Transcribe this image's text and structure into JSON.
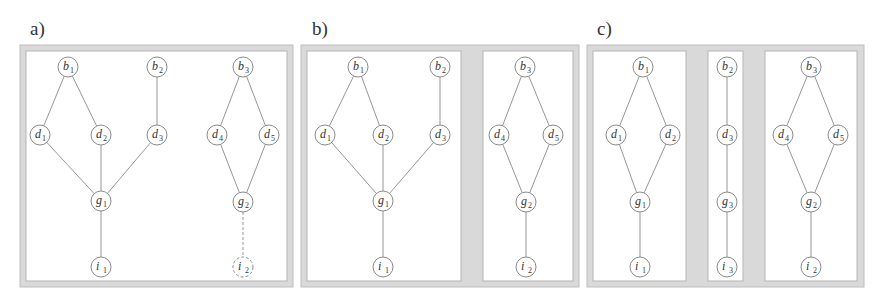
{
  "figure": {
    "colors": {
      "frame_fill": "#d9d9d9",
      "panel_fill": "#ffffff",
      "line": "#8a8a8a",
      "text": "#333333"
    },
    "node_radius": 10,
    "panels": [
      {
        "id": "a",
        "label": "a)",
        "label_pos": [
          30,
          35
        ],
        "outer": [
          20,
          45,
          273,
          242
        ],
        "sections": [
          [
            26,
            51,
            261,
            230
          ]
        ],
        "nodes": [
          {
            "id": "b1",
            "letter": "b",
            "sub": "1",
            "x": 68,
            "y": 67
          },
          {
            "id": "b2",
            "letter": "b",
            "sub": "2",
            "x": 157,
            "y": 67
          },
          {
            "id": "b3",
            "letter": "b",
            "sub": "3",
            "x": 243,
            "y": 67
          },
          {
            "id": "d1",
            "letter": "d",
            "sub": "1",
            "x": 40,
            "y": 135
          },
          {
            "id": "d2",
            "letter": "d",
            "sub": "2",
            "x": 101,
            "y": 135
          },
          {
            "id": "d3",
            "letter": "d",
            "sub": "3",
            "x": 157,
            "y": 135
          },
          {
            "id": "d4",
            "letter": "d",
            "sub": "4",
            "x": 217,
            "y": 135
          },
          {
            "id": "d5",
            "letter": "d",
            "sub": "5",
            "x": 269,
            "y": 135
          },
          {
            "id": "g1",
            "letter": "g",
            "sub": "1",
            "x": 101,
            "y": 201
          },
          {
            "id": "g2",
            "letter": "g",
            "sub": "2",
            "x": 243,
            "y": 202
          },
          {
            "id": "i1",
            "letter": "i",
            "sub": "1",
            "x": 101,
            "y": 267
          },
          {
            "id": "i2",
            "letter": "i",
            "sub": "2",
            "x": 243,
            "y": 267,
            "dashed": true
          }
        ],
        "edges": [
          [
            "b1",
            "d1"
          ],
          [
            "b1",
            "d2"
          ],
          [
            "b2",
            "d3"
          ],
          [
            "b3",
            "d4"
          ],
          [
            "b3",
            "d5"
          ],
          [
            "d1",
            "g1"
          ],
          [
            "d2",
            "g1"
          ],
          [
            "d3",
            "g1"
          ],
          [
            "d4",
            "g2"
          ],
          [
            "d5",
            "g2"
          ],
          [
            "g1",
            "i1"
          ],
          [
            "g2",
            "i2",
            "dashed"
          ]
        ]
      },
      {
        "id": "b",
        "label": "b)",
        "label_pos": [
          312,
          35
        ],
        "outer": [
          301,
          45,
          278,
          242
        ],
        "sections": [
          [
            307,
            51,
            154,
            230
          ],
          [
            483,
            51,
            90,
            230
          ]
        ],
        "nodes": [
          {
            "id": "b1",
            "letter": "b",
            "sub": "1",
            "x": 358,
            "y": 67
          },
          {
            "id": "b2",
            "letter": "b",
            "sub": "2",
            "x": 440,
            "y": 67
          },
          {
            "id": "b3",
            "letter": "b",
            "sub": "3",
            "x": 525,
            "y": 67
          },
          {
            "id": "d1",
            "letter": "d",
            "sub": "1",
            "x": 325,
            "y": 135
          },
          {
            "id": "d2",
            "letter": "d",
            "sub": "2",
            "x": 383,
            "y": 135
          },
          {
            "id": "d3",
            "letter": "d",
            "sub": "3",
            "x": 440,
            "y": 135
          },
          {
            "id": "d4",
            "letter": "d",
            "sub": "4",
            "x": 499,
            "y": 135
          },
          {
            "id": "d5",
            "letter": "d",
            "sub": "5",
            "x": 553,
            "y": 135
          },
          {
            "id": "g1",
            "letter": "g",
            "sub": "1",
            "x": 383,
            "y": 201
          },
          {
            "id": "g2",
            "letter": "g",
            "sub": "2",
            "x": 526,
            "y": 202
          },
          {
            "id": "i1",
            "letter": "i",
            "sub": "1",
            "x": 383,
            "y": 267
          },
          {
            "id": "i2",
            "letter": "i",
            "sub": "2",
            "x": 526,
            "y": 267
          }
        ],
        "edges": [
          [
            "b1",
            "d1"
          ],
          [
            "b1",
            "d2"
          ],
          [
            "b2",
            "d3"
          ],
          [
            "b3",
            "d4"
          ],
          [
            "b3",
            "d5"
          ],
          [
            "d1",
            "g1"
          ],
          [
            "d2",
            "g1"
          ],
          [
            "d3",
            "g1"
          ],
          [
            "d4",
            "g2"
          ],
          [
            "d5",
            "g2"
          ],
          [
            "g1",
            "i1"
          ],
          [
            "g2",
            "i2"
          ]
        ]
      },
      {
        "id": "c",
        "label": "c)",
        "label_pos": [
          597,
          35
        ],
        "outer": [
          587,
          45,
          277,
          242
        ],
        "sections": [
          [
            593,
            51,
            93,
            230
          ],
          [
            708,
            51,
            35,
            230
          ],
          [
            765,
            51,
            92,
            230
          ]
        ],
        "nodes": [
          {
            "id": "b1",
            "letter": "b",
            "sub": "1",
            "x": 643,
            "y": 67
          },
          {
            "id": "b2",
            "letter": "b",
            "sub": "2",
            "x": 727,
            "y": 67
          },
          {
            "id": "b3",
            "letter": "b",
            "sub": "3",
            "x": 811,
            "y": 67
          },
          {
            "id": "d1",
            "letter": "d",
            "sub": "1",
            "x": 616,
            "y": 135
          },
          {
            "id": "d2",
            "letter": "d",
            "sub": "2",
            "x": 670,
            "y": 135
          },
          {
            "id": "d3",
            "letter": "d",
            "sub": "3",
            "x": 727,
            "y": 135
          },
          {
            "id": "d4",
            "letter": "d",
            "sub": "4",
            "x": 783,
            "y": 135
          },
          {
            "id": "d5",
            "letter": "d",
            "sub": "5",
            "x": 838,
            "y": 135
          },
          {
            "id": "g1",
            "letter": "g",
            "sub": "1",
            "x": 640,
            "y": 202
          },
          {
            "id": "g3",
            "letter": "g",
            "sub": "3",
            "x": 727,
            "y": 202
          },
          {
            "id": "g2",
            "letter": "g",
            "sub": "2",
            "x": 811,
            "y": 202
          },
          {
            "id": "i1",
            "letter": "i",
            "sub": "1",
            "x": 640,
            "y": 267
          },
          {
            "id": "i3",
            "letter": "i",
            "sub": "3",
            "x": 727,
            "y": 267
          },
          {
            "id": "i2",
            "letter": "i",
            "sub": "2",
            "x": 811,
            "y": 267
          }
        ],
        "edges": [
          [
            "b1",
            "d1"
          ],
          [
            "b1",
            "d2"
          ],
          [
            "d1",
            "g1"
          ],
          [
            "d2",
            "g1"
          ],
          [
            "g1",
            "i1"
          ],
          [
            "b2",
            "d3"
          ],
          [
            "d3",
            "g3"
          ],
          [
            "g3",
            "i3"
          ],
          [
            "b3",
            "d4"
          ],
          [
            "b3",
            "d5"
          ],
          [
            "d4",
            "g2"
          ],
          [
            "d5",
            "g2"
          ],
          [
            "g2",
            "i2"
          ]
        ]
      }
    ]
  }
}
